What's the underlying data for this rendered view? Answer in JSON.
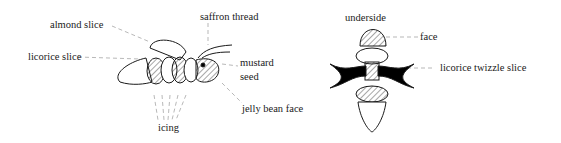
{
  "left_figure": {
    "labels": {
      "almond_slice": "almond slice",
      "saffron_thread": "saffron thread",
      "licorice_slice": "licorice slice",
      "mustard": "mustard",
      "seed": "seed",
      "jelly_bean_face": "jelly bean face",
      "icing": "icing"
    }
  },
  "right_figure": {
    "title": "underside",
    "labels": {
      "face": "face",
      "licorice_twizzle_slice": "licorice twizzle slice"
    }
  }
}
